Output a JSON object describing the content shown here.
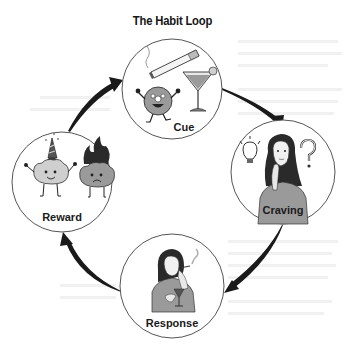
{
  "title": "The Habit Loop",
  "stages": [
    {
      "id": "cue",
      "label": "Cue",
      "icons": [
        "cigarette-icon",
        "donut-character-icon",
        "cocktail-glass-icon"
      ]
    },
    {
      "id": "craving",
      "label": "Craving",
      "icons": [
        "lightbulb-icon",
        "thinking-woman-icon",
        "question-mark-icon"
      ]
    },
    {
      "id": "response",
      "label": "Response",
      "icons": [
        "woman-smoking-drinking-icon"
      ]
    },
    {
      "id": "reward",
      "label": "Reward",
      "icons": [
        "happy-brain-party-hat-icon",
        "sad-brain-on-fire-icon"
      ]
    }
  ],
  "arrows": [
    {
      "from": "reward",
      "to": "cue"
    },
    {
      "from": "cue",
      "to": "craving"
    },
    {
      "from": "craving",
      "to": "response"
    },
    {
      "from": "response",
      "to": "reward"
    }
  ],
  "colors": {
    "ink": "#1a1a1a",
    "circle_stroke": "#555555",
    "fill_gray": "#9a9a9a",
    "light_gray": "#cfcfcf"
  }
}
